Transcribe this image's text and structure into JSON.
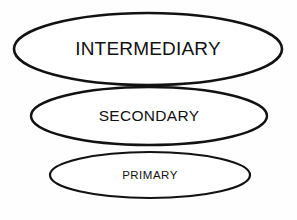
{
  "diagram": {
    "background_color": "#fefefe",
    "stroke_color": "#121212",
    "fill_color": "#ffffff",
    "text_color": "#111111",
    "levels": [
      {
        "id": "intermediary",
        "label": "INTERMEDIARY",
        "order": 3,
        "cx": 148,
        "cy": 49,
        "rx": 134,
        "ry": 36,
        "stroke_width": 2.6,
        "font_size": 19
      },
      {
        "id": "secondary",
        "label": "SECONDARY",
        "order": 2,
        "cx": 149,
        "cy": 116,
        "rx": 118,
        "ry": 29,
        "stroke_width": 2.4,
        "font_size": 15.5
      },
      {
        "id": "primary",
        "label": "PRIMARY",
        "order": 1,
        "cx": 150,
        "cy": 175,
        "rx": 100,
        "ry": 23,
        "stroke_width": 2.2,
        "font_size": 11.5
      }
    ]
  }
}
